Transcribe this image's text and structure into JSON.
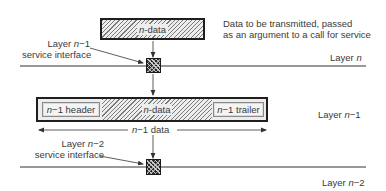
{
  "diagram": {
    "top_packet": {
      "label_prefix": "n",
      "label_suffix": "-data"
    },
    "top_annotation": {
      "line1": "Data to be transmitted, passed",
      "line2": "as an argument to a call for service"
    },
    "interface_upper": {
      "line1_prefix": "Layer ",
      "line1_var": "n",
      "line1_suffix": "−1",
      "line2": "service interface"
    },
    "layer_labels": {
      "layer_n_prefix": "Layer ",
      "layer_n_var": "n",
      "layer_n1_prefix": "Layer ",
      "layer_n1_var": "n",
      "layer_n1_suffix": "−1",
      "layer_n2_prefix": "Layer ",
      "layer_n2_var": "n",
      "layer_n2_suffix": "−2"
    },
    "frame": {
      "header_var": "n",
      "header_suffix": "−1 header",
      "data_var": "n",
      "data_suffix": "-data",
      "trailer_var": "n",
      "trailer_suffix": "−1 trailer"
    },
    "span_label": {
      "var": "n",
      "suffix": "−1 data"
    },
    "interface_lower": {
      "line1_prefix": "Layer ",
      "line1_var": "n",
      "line1_suffix": "−2",
      "line2": "service interface"
    },
    "colors": {
      "line": "#333333",
      "hatch": "#7a7a7a",
      "interface_box": "#1a1a1a"
    }
  }
}
